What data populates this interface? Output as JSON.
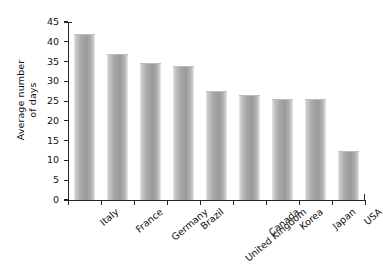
{
  "chart_data": {
    "type": "bar",
    "title": "",
    "subtitle": "",
    "xlabel": "",
    "ylabel": "Average number\nof days",
    "categories": [
      "Italy",
      "France",
      "Germany",
      "Brazil",
      "United Kingdom",
      "Canada",
      "Korea",
      "Japan",
      "USA"
    ],
    "values": [
      42.0,
      36.8,
      34.6,
      34.0,
      27.5,
      26.5,
      25.6,
      25.6,
      12.3
    ],
    "ylim": [
      0,
      45
    ],
    "ytick_values": [
      0,
      5,
      10,
      15,
      20,
      25,
      30,
      35,
      40,
      45
    ],
    "ytick_labels": [
      "0",
      "5",
      "10",
      "15",
      "20",
      "25",
      "30",
      "35",
      "40",
      "45"
    ],
    "grid": false,
    "legend": null,
    "legend_position": "none",
    "bar_color": "#a5a5a5",
    "axis_color": "#262626",
    "background_color": "#ffffff",
    "xlabel_rotation": -40
  }
}
